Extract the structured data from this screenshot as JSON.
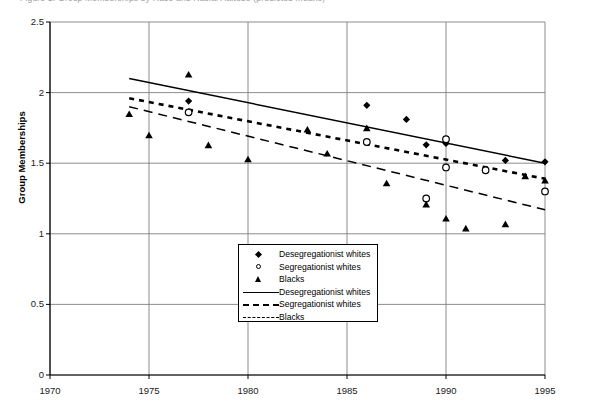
{
  "top_strip": {
    "text": "Figure 1. Group Memberships by Race and Racial Attitude (predicted means)"
  },
  "chart_data": {
    "type": "scatter",
    "title": "",
    "xlabel": "",
    "ylabel": "Group Memberships",
    "xlim": [
      1970,
      1995
    ],
    "ylim": [
      0,
      2.5
    ],
    "xticks": [
      "1970",
      "1975",
      "1980",
      "1985",
      "1990",
      "1995"
    ],
    "yticks": [
      "0",
      "0.5",
      "1",
      "1.5",
      "2",
      "2.5"
    ],
    "grid": true,
    "legend_position": "inside-bottom-center",
    "series": [
      {
        "name": "Desegregationist whites",
        "marker": "filled-diamond",
        "points": [
          {
            "x": 1977,
            "y": 1.94
          },
          {
            "x": 1986,
            "y": 1.91
          },
          {
            "x": 1988,
            "y": 1.81
          },
          {
            "x": 1989,
            "y": 1.63
          },
          {
            "x": 1990,
            "y": 1.64
          },
          {
            "x": 1993,
            "y": 1.52
          },
          {
            "x": 1995,
            "y": 1.51
          }
        ]
      },
      {
        "name": "Segregationist whites",
        "marker": "open-circle",
        "points": [
          {
            "x": 1977,
            "y": 1.86
          },
          {
            "x": 1986,
            "y": 1.65
          },
          {
            "x": 1989,
            "y": 1.25
          },
          {
            "x": 1990,
            "y": 1.67
          },
          {
            "x": 1990,
            "y": 1.47
          },
          {
            "x": 1992,
            "y": 1.45
          },
          {
            "x": 1995,
            "y": 1.3
          }
        ]
      },
      {
        "name": "Blacks",
        "marker": "filled-triangle",
        "points": [
          {
            "x": 1974,
            "y": 1.85
          },
          {
            "x": 1975,
            "y": 1.7
          },
          {
            "x": 1977,
            "y": 2.13
          },
          {
            "x": 1978,
            "y": 1.63
          },
          {
            "x": 1980,
            "y": 1.53
          },
          {
            "x": 1983,
            "y": 1.74
          },
          {
            "x": 1984,
            "y": 1.57
          },
          {
            "x": 1986,
            "y": 1.75
          },
          {
            "x": 1987,
            "y": 1.36
          },
          {
            "x": 1989,
            "y": 1.21
          },
          {
            "x": 1990,
            "y": 1.11
          },
          {
            "x": 1991,
            "y": 1.04
          },
          {
            "x": 1993,
            "y": 1.07
          },
          {
            "x": 1994,
            "y": 1.41
          },
          {
            "x": 1995,
            "y": 1.38
          }
        ]
      }
    ],
    "trendlines": [
      {
        "name": "Desegregationist whites",
        "style": "solid",
        "x0": 1974,
        "y0": 2.1,
        "x1": 1995,
        "y1": 1.5
      },
      {
        "name": "Segregationist whites",
        "style": "dotted",
        "x0": 1974,
        "y0": 1.96,
        "x1": 1995,
        "y1": 1.39
      },
      {
        "name": "Blacks",
        "style": "dashed",
        "x0": 1974,
        "y0": 1.9,
        "x1": 1995,
        "y1": 1.17
      }
    ]
  },
  "legend": {
    "items": [
      {
        "key": "filled-diamond",
        "label": "Desegregationist whites"
      },
      {
        "key": "open-circle",
        "label": "Segregationist whites"
      },
      {
        "key": "filled-triangle",
        "label": "Blacks"
      },
      {
        "key": "solid-line",
        "label": "Desegregationist whites"
      },
      {
        "key": "dotted-line",
        "label": "Segregationist whites"
      },
      {
        "key": "dashed-line",
        "label": "Blacks"
      }
    ]
  },
  "colors": {
    "ink": "#000000",
    "grid": "#808080",
    "background": "#ffffff"
  }
}
